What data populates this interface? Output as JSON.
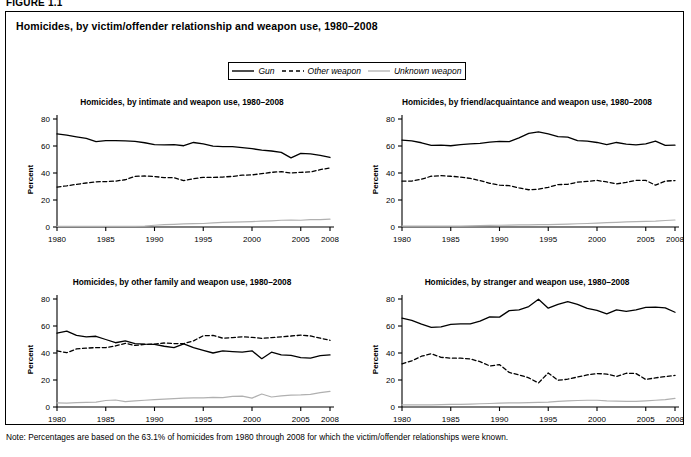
{
  "figure": {
    "label": "FIGURE 1.1",
    "title": "Homicides, by victim/offender relationship and weapon use, 1980–2008",
    "note": "Note: Percentages are based on the 63.1% of homicides from 1980 through 2008 for which the victim/offender relationships were known."
  },
  "legend": {
    "items": [
      {
        "label": "Gun",
        "style": "solid",
        "color": "#000000",
        "icon": "solid-line-icon"
      },
      {
        "label": "Other weapon",
        "style": "dashed",
        "color": "#000000",
        "icon": "dashed-line-icon"
      },
      {
        "label": "Unknown weapon",
        "style": "solid-light",
        "color": "#b0b0b0",
        "icon": "light-line-icon"
      }
    ]
  },
  "axes": {
    "ylabel": "Percent",
    "yticks": [
      0,
      20,
      40,
      60,
      80
    ],
    "ylim": [
      0,
      80
    ],
    "xticks": [
      1980,
      1985,
      1990,
      1995,
      2000,
      2005,
      2008
    ],
    "xlim": [
      1980,
      2008
    ],
    "xtick_labels": [
      "1980",
      "1985",
      "1990",
      "1995",
      "2000",
      "2005",
      "2008"
    ],
    "ytick_labels": [
      "0",
      "20",
      "40",
      "60",
      "80"
    ]
  },
  "chart_data": [
    {
      "type": "line",
      "panel": "intimate",
      "title": "Homicides, by intimate and weapon use, 1980–2008",
      "xlabel": "",
      "ylabel": "Percent",
      "ylim": [
        0,
        80
      ],
      "xlim": [
        1980,
        2008
      ],
      "grid": false,
      "legend_position": "figure-top-center",
      "x": [
        1980,
        1981,
        1982,
        1983,
        1984,
        1985,
        1986,
        1987,
        1988,
        1989,
        1990,
        1991,
        1992,
        1993,
        1994,
        1995,
        1996,
        1997,
        1998,
        1999,
        2000,
        2001,
        2002,
        2003,
        2004,
        2005,
        2006,
        2007,
        2008
      ],
      "series": [
        {
          "name": "Gun",
          "style": "solid",
          "color": "#000000",
          "values": [
            69.0,
            68.0,
            66.8,
            65.6,
            63.3,
            64.0,
            64.0,
            63.8,
            63.5,
            62.4,
            61.0,
            60.8,
            61.0,
            60.2,
            62.6,
            61.6,
            59.9,
            59.6,
            59.5,
            58.8,
            58.0,
            57.0,
            56.3,
            55.3,
            51.2,
            54.5,
            54.2,
            53.0,
            51.5
          ]
        },
        {
          "name": "Other weapon",
          "style": "dashed",
          "color": "#000000",
          "values": [
            29.6,
            30.5,
            31.6,
            32.6,
            33.5,
            33.6,
            34.0,
            35.0,
            37.5,
            37.8,
            37.4,
            36.6,
            36.5,
            34.4,
            35.8,
            36.8,
            36.7,
            37.0,
            37.5,
            38.4,
            38.6,
            39.5,
            40.5,
            41.0,
            40.0,
            40.5,
            40.8,
            42.5,
            43.8
          ]
        },
        {
          "name": "Unknown weapon",
          "style": "solid-light",
          "color": "#b0b0b0",
          "values": [
            0.4,
            0.4,
            0.4,
            0.4,
            0.4,
            0.4,
            0.4,
            0.4,
            0.4,
            0.7,
            1.3,
            1.8,
            2.0,
            2.3,
            2.5,
            2.6,
            3.0,
            3.4,
            3.6,
            3.8,
            4.0,
            4.3,
            4.6,
            5.0,
            5.2,
            5.0,
            5.4,
            5.5,
            5.8
          ]
        }
      ]
    },
    {
      "type": "line",
      "panel": "friend-acquaintance",
      "title": "Homicides, by friend/acquaintance and weapon use, 1980–2008",
      "xlabel": "",
      "ylabel": "Percent",
      "ylim": [
        0,
        80
      ],
      "xlim": [
        1980,
        2008
      ],
      "grid": false,
      "legend_position": "figure-top-center",
      "x": [
        1980,
        1981,
        1982,
        1983,
        1984,
        1985,
        1986,
        1987,
        1988,
        1989,
        1990,
        1991,
        1992,
        1993,
        1994,
        1995,
        1996,
        1997,
        1998,
        1999,
        2000,
        2001,
        2002,
        2003,
        2004,
        2005,
        2006,
        2007,
        2008
      ],
      "series": [
        {
          "name": "Gun",
          "style": "solid",
          "color": "#000000",
          "values": [
            64.4,
            63.8,
            62.4,
            60.4,
            60.6,
            60.2,
            61.0,
            61.6,
            62.0,
            62.8,
            63.4,
            63.2,
            66.0,
            69.3,
            70.4,
            69.0,
            67.0,
            66.6,
            64.0,
            63.6,
            62.6,
            61.0,
            62.6,
            61.4,
            60.8,
            61.6,
            63.6,
            60.4,
            60.6
          ]
        },
        {
          "name": "Other weapon",
          "style": "dashed",
          "color": "#000000",
          "values": [
            34.0,
            34.0,
            35.4,
            37.6,
            38.0,
            37.6,
            37.0,
            36.0,
            34.4,
            32.4,
            31.0,
            30.6,
            29.0,
            27.6,
            28.0,
            29.4,
            31.4,
            31.6,
            33.2,
            33.8,
            34.5,
            33.4,
            32.0,
            33.0,
            34.6,
            34.5,
            31.0,
            34.0,
            34.4
          ]
        },
        {
          "name": "Unknown weapon",
          "style": "solid-light",
          "color": "#b0b0b0",
          "values": [
            0.6,
            0.6,
            0.6,
            0.6,
            0.6,
            0.6,
            0.6,
            0.8,
            1.0,
            1.2,
            1.3,
            1.4,
            1.5,
            1.6,
            1.7,
            1.8,
            2.0,
            2.2,
            2.4,
            2.6,
            2.9,
            3.2,
            3.5,
            3.8,
            4.0,
            4.2,
            4.4,
            4.8,
            5.2
          ]
        }
      ]
    },
    {
      "type": "line",
      "panel": "other-family",
      "title": "Homicides, by other family and weapon use, 1980–2008",
      "xlabel": "",
      "ylabel": "Percent",
      "ylim": [
        0,
        80
      ],
      "xlim": [
        1980,
        2008
      ],
      "grid": false,
      "legend_position": "figure-top-center",
      "x": [
        1980,
        1981,
        1982,
        1983,
        1984,
        1985,
        1986,
        1987,
        1988,
        1989,
        1990,
        1991,
        1992,
        1993,
        1994,
        1995,
        1996,
        1997,
        1998,
        1999,
        2000,
        2001,
        2002,
        2003,
        2004,
        2005,
        2006,
        2007,
        2008
      ],
      "series": [
        {
          "name": "Gun",
          "style": "solid",
          "color": "#000000",
          "values": [
            54.8,
            56.2,
            53.0,
            52.0,
            52.4,
            50.0,
            47.6,
            49.0,
            47.0,
            46.6,
            46.4,
            45.0,
            44.0,
            46.8,
            44.0,
            42.0,
            40.0,
            41.5,
            41.0,
            40.6,
            41.6,
            35.8,
            40.6,
            38.6,
            38.2,
            36.6,
            36.2,
            38.0,
            38.6
          ]
        },
        {
          "name": "Other weapon",
          "style": "dashed",
          "color": "#000000",
          "values": [
            41.6,
            40.2,
            43.0,
            43.6,
            44.0,
            44.0,
            45.2,
            47.2,
            45.6,
            46.4,
            46.6,
            47.4,
            47.0,
            47.0,
            49.0,
            52.8,
            53.0,
            51.0,
            51.4,
            52.0,
            51.6,
            50.8,
            51.4,
            52.0,
            52.6,
            53.2,
            52.6,
            51.0,
            49.4
          ]
        },
        {
          "name": "Unknown weapon",
          "style": "solid-light",
          "color": "#b0b0b0",
          "values": [
            3.0,
            2.8,
            3.2,
            3.4,
            3.6,
            4.8,
            5.2,
            4.0,
            4.6,
            5.0,
            5.4,
            5.8,
            6.2,
            6.6,
            6.8,
            6.8,
            7.2,
            7.0,
            7.8,
            8.0,
            6.6,
            9.6,
            7.4,
            8.2,
            8.8,
            9.0,
            9.4,
            10.6,
            11.6
          ]
        }
      ]
    },
    {
      "type": "line",
      "panel": "stranger",
      "title": "Homicides, by stranger and weapon use, 1980–2008",
      "xlabel": "",
      "ylabel": "Percent",
      "ylim": [
        0,
        80
      ],
      "xlim": [
        1980,
        2008
      ],
      "grid": false,
      "legend_position": "figure-top-center",
      "x": [
        1980,
        1981,
        1982,
        1983,
        1984,
        1985,
        1986,
        1987,
        1988,
        1989,
        1990,
        1991,
        1992,
        1993,
        1994,
        1995,
        1996,
        1997,
        1998,
        1999,
        2000,
        2001,
        2002,
        2003,
        2004,
        2005,
        2006,
        2007,
        2008
      ],
      "series": [
        {
          "name": "Gun",
          "style": "solid",
          "color": "#000000",
          "values": [
            65.8,
            64.2,
            61.4,
            59.0,
            59.4,
            61.2,
            61.6,
            61.6,
            63.6,
            66.8,
            66.6,
            71.4,
            72.0,
            74.4,
            79.8,
            73.2,
            76.0,
            78.0,
            76.0,
            73.0,
            71.6,
            69.0,
            72.0,
            70.8,
            72.0,
            73.8,
            74.0,
            73.4,
            70.2
          ]
        },
        {
          "name": "Other weapon",
          "style": "dashed",
          "color": "#000000",
          "values": [
            32.0,
            34.2,
            37.6,
            39.4,
            36.8,
            36.2,
            36.2,
            35.6,
            33.6,
            30.4,
            31.4,
            25.6,
            23.8,
            21.6,
            17.8,
            25.2,
            19.8,
            20.6,
            22.2,
            23.8,
            24.8,
            24.4,
            22.6,
            25.0,
            24.8,
            20.4,
            21.6,
            22.6,
            23.4
          ]
        },
        {
          "name": "Unknown weapon",
          "style": "solid-light",
          "color": "#b0b0b0",
          "values": [
            1.6,
            1.6,
            1.6,
            1.6,
            1.8,
            2.0,
            2.0,
            2.2,
            2.4,
            2.6,
            2.8,
            3.0,
            3.0,
            3.2,
            3.4,
            3.6,
            4.2,
            4.6,
            4.8,
            5.0,
            5.0,
            4.6,
            4.4,
            4.2,
            4.2,
            4.6,
            5.0,
            5.4,
            6.4
          ]
        }
      ]
    }
  ]
}
